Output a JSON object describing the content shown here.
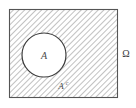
{
  "figure": {
    "caption_type": "set-complement-venn-diagram"
  },
  "universe": {
    "label": "Ω",
    "shape": "square",
    "fill_pattern": "diagonal-hatch",
    "border_color": "#555555",
    "hatch_color": "#8c8c8c",
    "hatch_angle_deg": 45,
    "hatch_spacing_px": 4,
    "bounds": {
      "x": 9,
      "y": 9,
      "width": 109,
      "height": 89
    }
  },
  "set_a": {
    "label": "A",
    "shape": "circle",
    "fill_color": "#ffffff",
    "border_color": "#3c3c3c",
    "center": {
      "x": 44,
      "y": 55
    },
    "radius": 22
  },
  "complement": {
    "label": "A",
    "superscript": "c",
    "label_full": "Aᶜ",
    "region": "hatched-area-outside-circle",
    "position": {
      "x": 63,
      "y": 88
    }
  },
  "colors": {
    "background": "#ffffff",
    "hatch": "#8c8c8c",
    "square_border": "#555555",
    "circle_border": "#3c3c3c",
    "label": "#4a4a4a"
  }
}
